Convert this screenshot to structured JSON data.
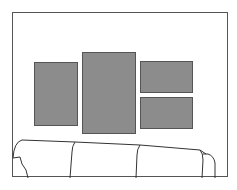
{
  "scene": {
    "caption": "",
    "wall_color": "#ffffff",
    "frame_color": "#8c8c8c",
    "frames": [
      {
        "name": "left-frame",
        "x": 34,
        "y": 62,
        "w": 44,
        "h": 64
      },
      {
        "name": "center-frame",
        "x": 82,
        "y": 52,
        "w": 54,
        "h": 82
      },
      {
        "name": "right-top-frame",
        "x": 140,
        "y": 61,
        "w": 53,
        "h": 32
      },
      {
        "name": "right-bottom-frame",
        "x": 140,
        "y": 97,
        "w": 53,
        "h": 32
      }
    ],
    "furniture": "sofa"
  }
}
